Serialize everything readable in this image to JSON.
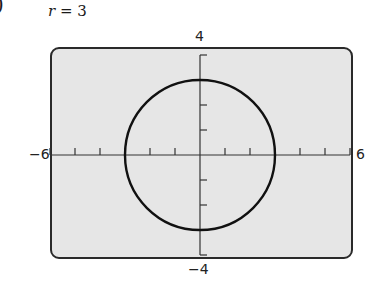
{
  "figure_label": ")",
  "title": {
    "var": "r",
    "eq": " = 3"
  },
  "window": {
    "xmin": "−6",
    "xmax": "6",
    "ymin": "−4",
    "ymax": "4"
  },
  "chart_data": {
    "type": "line",
    "title": "r = 3",
    "xlim": [
      -6,
      6
    ],
    "ylim": [
      -4,
      4
    ],
    "xticks": [
      -6,
      -5,
      -4,
      -3,
      -2,
      -1,
      0,
      1,
      2,
      3,
      4,
      5,
      6
    ],
    "yticks": [
      -4,
      -3,
      -2,
      -1,
      0,
      1,
      2,
      3,
      4
    ],
    "tick_labels": {
      "left": "−6",
      "right": "6",
      "top": "4",
      "bottom": "−4"
    },
    "series": [
      {
        "name": "r = 3",
        "shape": "circle",
        "center": [
          0,
          0
        ],
        "radius": 3
      }
    ],
    "grid": false,
    "colors": {
      "background": "#e6e6e6",
      "curve": "#111111",
      "axes": "#333333"
    }
  }
}
